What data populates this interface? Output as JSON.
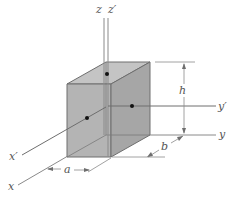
{
  "diagram": {
    "type": "3d-rectangular-block-with-axes",
    "colors": {
      "front_face": "#b4b4b4",
      "top_face": "#c2c2c2",
      "side_face": "#a8a8a8",
      "edge": "#6e6e6e",
      "axis": "#8a8a8a",
      "dimension": "#8a8a8a",
      "dot": "#111111",
      "label": "#555555"
    },
    "axes": {
      "z": "z",
      "z_prime": "z′",
      "y": "y",
      "y_prime": "y′",
      "x": "x",
      "x_prime": "x′"
    },
    "dimensions": {
      "width": "a",
      "depth": "b",
      "height": "h"
    }
  }
}
